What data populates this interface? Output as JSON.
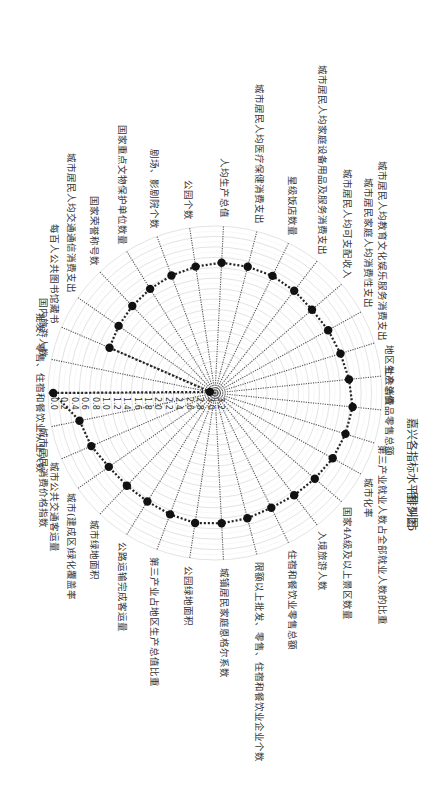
{
  "figure": {
    "caption_number": "图 5-25",
    "caption_title": "嘉兴各指标水平排列图"
  },
  "chart_data": {
    "type": "radar",
    "title": "嘉兴各指标水平排列图",
    "caption": "图 5-25 嘉兴各指标水平排列图",
    "orientation": "page rotated 90° clockwise; first axis points left, axes proceed clockwise",
    "radial_axis": {
      "ticks": [
        "0.0",
        "0.2",
        "0.4",
        "0.6",
        "0.8",
        "1.0",
        "1.2",
        "1.4",
        "1.6",
        "1.8",
        "2.0",
        "2.2",
        "2.4",
        "2.6",
        "2.8",
        "3.0",
        "3.2"
      ],
      "range": [
        0.0,
        3.2
      ],
      "direction": "0.0 at outer ring, 3.2 at center"
    },
    "grid": true,
    "categories": [
      "批发、零售、住宿和餐饮业从业人数",
      "国内旅游人数",
      "每百人公共图书馆藏书",
      "城市居民人均交通通信消费支出",
      "国家荣誉称号数",
      "国家重点文物保护单位数量",
      "剧场、影剧院个数",
      "公园个数",
      "人均生产总值",
      "城市居民人均医疗保健消费支出",
      "星级饭店数量",
      "城市居民人均家庭设备用品及服务消费支出",
      "城市居民人均可支配收入",
      "城市居民家庭人均消费性支出",
      "城市居民人均教育文化娱乐服务消费支出",
      "地区生产总值",
      "社会消费品零售总额",
      "第三产业就业人数占全部就业人数的比重",
      "城市化率",
      "国家4A级及以上景区数量",
      "入境旅游人数",
      "住宿和餐饮业零售总额",
      "限额以上批发、零售、住宿和餐饮业企业个数",
      "城镇居民家庭恩格尔系数",
      "公园绿地面积",
      "第三产业占地区生产总值比重",
      "公路运输完成客运量",
      "城市绿地面积",
      "城市(建成区)绿化覆盖率",
      "城市公共交通客运量",
      "城市居民消费价格指数"
    ],
    "series": [
      {
        "name": "嘉兴",
        "values": [
          0.1,
          3.1,
          1.0,
          0.95,
          0.9,
          0.85,
          0.8,
          0.75,
          0.7,
          0.7,
          0.7,
          0.72,
          0.75,
          0.72,
          0.68,
          0.62,
          0.55,
          0.58,
          0.62,
          0.68,
          0.72,
          0.75,
          0.72,
          0.7,
          0.68,
          0.72,
          0.75,
          0.75,
          0.72,
          0.62,
          0.55
        ]
      }
    ]
  }
}
